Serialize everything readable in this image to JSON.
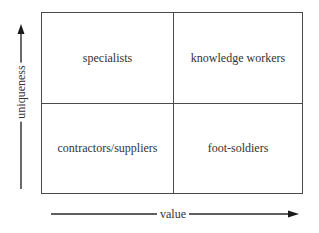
{
  "diagram": {
    "type": "2x2-matrix",
    "quadrants": {
      "top_left": "specialists",
      "top_right": "knowledge workers",
      "bottom_left": "contractors/suppliers",
      "bottom_right": "foot-soldiers"
    },
    "axes": {
      "y": {
        "label": "uniqueness",
        "direction": "up"
      },
      "x": {
        "label": "value",
        "direction": "right"
      }
    },
    "colors": {
      "line": "#4a4a4a",
      "text": "#333333",
      "background": "#ffffff"
    }
  }
}
